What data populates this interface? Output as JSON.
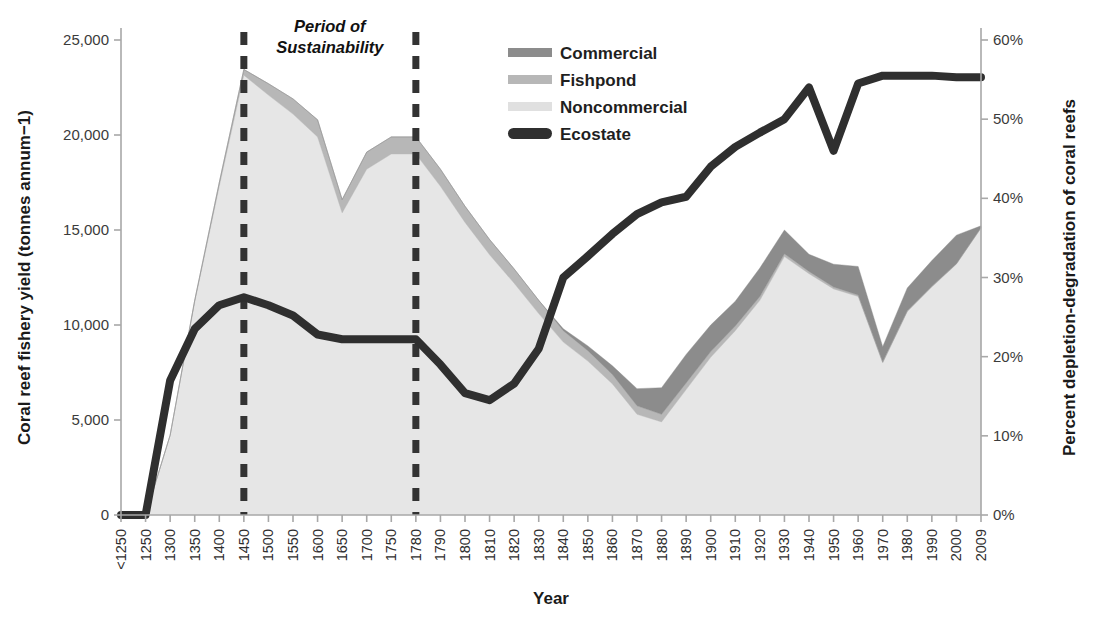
{
  "chart_data": {
    "type": "area",
    "title": "",
    "xlabel": "Year",
    "ylabel": "Coral reef fishery yield (tonnes annum−1)",
    "ylabel_right": "Percent depletion-degradation of coral reefs",
    "grid": false,
    "legend_position": "top-center",
    "ylim": [
      0,
      25000
    ],
    "ylim_right": [
      0,
      60
    ],
    "yticks": [
      "0",
      "5,000",
      "10,000",
      "15,000",
      "20,000",
      "25,000"
    ],
    "ytick_values": [
      0,
      5000,
      10000,
      15000,
      20000,
      25000
    ],
    "yticks_right": [
      "0%",
      "10%",
      "20%",
      "30%",
      "40%",
      "50%",
      "60%"
    ],
    "ytick_values_right": [
      0,
      10,
      20,
      30,
      40,
      50,
      60
    ],
    "categories": [
      "<1250",
      "1250",
      "1300",
      "1350",
      "1400",
      "1450",
      "1500",
      "1550",
      "1600",
      "1650",
      "1700",
      "1750",
      "1780",
      "1790",
      "1800",
      "1810",
      "1820",
      "1830",
      "1840",
      "1850",
      "1860",
      "1870",
      "1880",
      "1890",
      "1900",
      "1910",
      "1920",
      "1930",
      "1940",
      "1950",
      "1960",
      "1970",
      "1980",
      "1990",
      "2000",
      "2009"
    ],
    "series": [
      {
        "name": "Noncommercial",
        "axis": "left",
        "color": "#e6e6e6",
        "stack": 1,
        "values": [
          0,
          0,
          4200,
          11200,
          17300,
          23150,
          22100,
          21100,
          19900,
          15900,
          18200,
          19000,
          19000,
          17300,
          15400,
          13700,
          12200,
          10600,
          9100,
          8100,
          6900,
          5300,
          4900,
          6600,
          8300,
          9700,
          11300,
          13600,
          12700,
          11900,
          11500,
          8000,
          10700,
          12000,
          13200,
          15100
        ]
      },
      {
        "name": "Fishpond",
        "axis": "left",
        "color": "#b7b7b7",
        "stack": 2,
        "values": [
          0,
          0,
          0,
          100,
          200,
          300,
          600,
          800,
          900,
          700,
          900,
          900,
          900,
          900,
          850,
          800,
          750,
          700,
          600,
          550,
          500,
          450,
          400,
          350,
          300,
          250,
          200,
          150,
          120,
          100,
          80,
          60,
          50,
          40,
          30,
          20
        ]
      },
      {
        "name": "Commercial",
        "axis": "left",
        "color": "#8c8c8c",
        "stack": 3,
        "values": [
          0,
          0,
          0,
          0,
          0,
          0,
          0,
          0,
          0,
          0,
          0,
          0,
          0,
          0,
          0,
          0,
          0,
          0,
          100,
          250,
          450,
          900,
          1400,
          1500,
          1400,
          1300,
          1500,
          1250,
          900,
          1200,
          1500,
          800,
          1200,
          1350,
          1500,
          100
        ]
      },
      {
        "name": "Ecostate",
        "axis": "right",
        "color": "#2f2f2f",
        "type": "line",
        "values": [
          0,
          0,
          17,
          23.5,
          26.5,
          27.5,
          26.5,
          25.2,
          22.8,
          22.2,
          22.2,
          22.2,
          22.2,
          19.0,
          15.4,
          14.5,
          16.6,
          21.0,
          30.0,
          32.7,
          35.5,
          38.0,
          39.5,
          40.2,
          44.0,
          46.5,
          48.3,
          50.0,
          54.0,
          46.0,
          54.5,
          55.5,
          55.5,
          55.5,
          55.3,
          55.3
        ]
      }
    ],
    "annotations": [
      {
        "text_line1": "Period of",
        "text_line2": "Sustainability",
        "start_category": "1450",
        "end_category": "1780"
      }
    ],
    "legend": [
      {
        "label": "Commercial",
        "color": "#8c8c8c",
        "marker": "swatch"
      },
      {
        "label": "Fishpond",
        "color": "#b7b7b7",
        "marker": "swatch"
      },
      {
        "label": "Noncommercial",
        "color": "#e0e0e0",
        "marker": "swatch"
      },
      {
        "label": "Ecostate",
        "color": "#2f2f2f",
        "marker": "line"
      }
    ]
  }
}
